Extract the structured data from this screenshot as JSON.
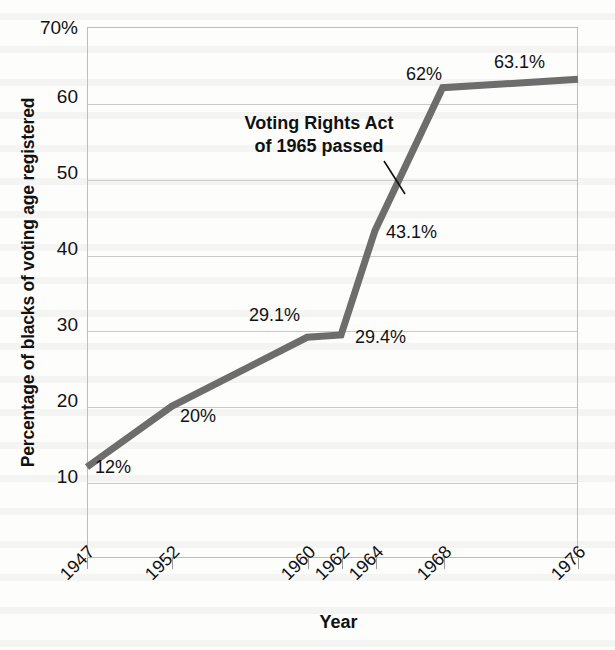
{
  "chart_data": {
    "type": "line",
    "title": "",
    "xlabel": "Year",
    "ylabel": "Percentage of blacks of voting age registered",
    "x": [
      1947,
      1952,
      1960,
      1962,
      1964,
      1968,
      1976
    ],
    "categories": [
      "1947",
      "1952",
      "1960",
      "1962",
      "1964",
      "1968",
      "1976"
    ],
    "values": [
      12,
      20,
      29.1,
      29.4,
      43.1,
      62,
      63.1
    ],
    "point_labels": [
      "12%",
      "20%",
      "29.1%",
      "29.4%",
      "43.1%",
      "62%",
      "63.1%"
    ],
    "xlim": [
      1947,
      1976
    ],
    "ylim": [
      0,
      70
    ],
    "yticks": [
      10,
      20,
      30,
      40,
      50,
      60,
      70
    ],
    "ytick_labels": [
      "10",
      "20",
      "30",
      "40",
      "50",
      "60",
      "70%"
    ],
    "xtick_labels": [
      "1947",
      "1952",
      "1960",
      "1962",
      "1964",
      "1968",
      "1976"
    ],
    "grid": "horizontal",
    "legend": "none",
    "series_color": "#6d6d6d",
    "grid_color": "#c9c9c9",
    "text_color": "#111111",
    "background_color": "#fdfdfc",
    "annotations": [
      {
        "line1": "Voting Rights Act",
        "line2": "of 1965 passed"
      }
    ]
  },
  "axis": {
    "y_title": "Percentage of blacks of voting age registered",
    "x_title": "Year"
  }
}
